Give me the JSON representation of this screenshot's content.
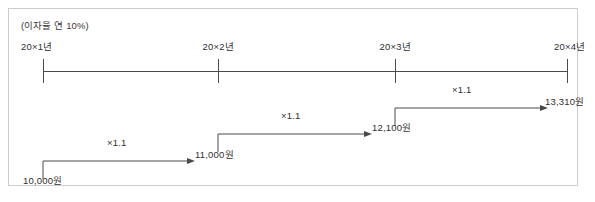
{
  "figure": {
    "interest_note": "(이자율 연 10%)",
    "timeline": {
      "ticks": [
        {
          "label": "20×1년",
          "x": 34
        },
        {
          "label": "20×2년",
          "x": 209
        },
        {
          "label": "20×3년",
          "x": 386
        },
        {
          "label": "20×4년",
          "x": 558
        }
      ],
      "axis_y": 62,
      "axis_x_start": 34,
      "axis_x_end": 558
    },
    "flows": [
      {
        "from_amount": "10,000원",
        "to_amount": "11,000원",
        "factor": "×1.1",
        "from_x": 34,
        "to_x": 180,
        "row_y": 152,
        "amount_y": 170
      },
      {
        "from_amount": "11,000원",
        "to_amount": "12,100원",
        "factor": "×1.1",
        "from_x": 209,
        "to_x": 357,
        "row_y": 125,
        "amount_y": 143
      },
      {
        "from_amount": "12,100원",
        "to_amount": "13,310원",
        "factor": "×1.1",
        "from_x": 386,
        "to_x": 533,
        "row_y": 99,
        "amount_y": 117
      }
    ],
    "amounts": [
      {
        "text": "10,000원",
        "x": 14,
        "y": 164
      },
      {
        "text": "11,000원",
        "x": 186,
        "y": 138
      },
      {
        "text": "12,100원",
        "x": 363,
        "y": 111
      },
      {
        "text": "13,310원",
        "x": 536,
        "y": 85
      }
    ],
    "factors": [
      {
        "text": "×1.1",
        "x": 98,
        "y": 128
      },
      {
        "text": "×1.1",
        "x": 272,
        "y": 101
      },
      {
        "text": "×1.1",
        "x": 443,
        "y": 75
      }
    ],
    "colors": {
      "border": "#c9ccd0",
      "line": "#4a4a4a",
      "text": "#2f2f2f",
      "background": "#ffffff"
    }
  }
}
